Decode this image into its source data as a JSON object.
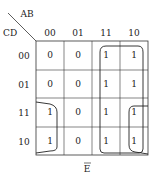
{
  "kmap": {
    "row_var": "CD",
    "col_var": "AB",
    "col_headers": [
      "00",
      "01",
      "11",
      "10"
    ],
    "row_headers": [
      "00",
      "01",
      "11",
      "10"
    ],
    "cells": [
      [
        "0",
        "0",
        "1",
        "1"
      ],
      [
        "0",
        "0",
        "1",
        "1"
      ],
      [
        "1",
        "0",
        "1",
        "1"
      ],
      [
        "1",
        "0",
        "1",
        "1"
      ]
    ],
    "caption": "E",
    "caption_overbar": true
  }
}
